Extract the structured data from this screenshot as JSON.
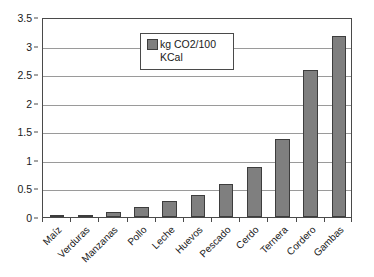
{
  "chart_data": {
    "type": "bar",
    "title": "",
    "subtitle": "",
    "xlabel": "",
    "ylabel": "",
    "ylim": [
      0,
      3.5
    ],
    "ytick_values": [
      0,
      0.5,
      1,
      1.5,
      2,
      2.5,
      3,
      3.5
    ],
    "ytick_labels": [
      "0",
      "0.5",
      "1",
      "1.5",
      "2",
      "2.5",
      "3",
      "3.5"
    ],
    "grid": true,
    "legend_position": "upper center",
    "categories": [
      "Maíz",
      "Verduras",
      "Manzanas",
      "Pollo",
      "Leche",
      "Huevos",
      "Pescado",
      "Cerdo",
      "Ternera",
      "Cordero",
      "Gambas"
    ],
    "series": [
      {
        "name": "kg CO2/100 KCal",
        "color": "#7f7f7f",
        "values": [
          0.03,
          0.04,
          0.08,
          0.17,
          0.28,
          0.38,
          0.58,
          0.88,
          1.37,
          2.57,
          3.17
        ]
      }
    ]
  },
  "legend": {
    "label": "kg CO2/100\nKCal",
    "swatch_color": "#7f7f7f"
  },
  "axes": {
    "bar_color": "#7f7f7f",
    "bar_outline_color": "#3d3d3d",
    "frame_color": "#4a4a4a",
    "gridline_color": "#9a9a9a"
  }
}
